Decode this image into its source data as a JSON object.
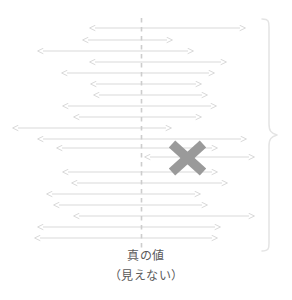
{
  "figure": {
    "title": "",
    "caption_primary": "真の値",
    "caption_secondary": "（見えない）",
    "colors": {
      "arrow": "#d9d9d9",
      "arrow_dark": "#cfcfcf",
      "dashed_line": "#cfcfcf",
      "x_marker": "#9a9a9a",
      "brace": "#e2e2e2",
      "text": "#5a5a5a",
      "background": "#ffffff"
    }
  },
  "chart_data": {
    "type": "line",
    "xlabel": "",
    "ylabel": "",
    "grid": false,
    "legend": "none",
    "true_value_x": 141,
    "xlim": [
      0,
      292
    ],
    "series": [
      {
        "name": "intervals",
        "interval_count": 20,
        "values": [
          {
            "row": 1,
            "y": 28,
            "left": 95,
            "right": 240,
            "covers": true,
            "marked": false
          },
          {
            "row": 2,
            "y": 40,
            "left": 88,
            "right": 167,
            "covers": true,
            "marked": false
          },
          {
            "row": 3,
            "y": 51,
            "left": 43,
            "right": 188,
            "covers": true,
            "marked": false
          },
          {
            "row": 4,
            "y": 62,
            "left": 95,
            "right": 221,
            "covers": true,
            "marked": false
          },
          {
            "row": 5,
            "y": 73,
            "left": 67,
            "right": 209,
            "covers": true,
            "marked": false
          },
          {
            "row": 6,
            "y": 84,
            "left": 96,
            "right": 196,
            "covers": true,
            "marked": false
          },
          {
            "row": 7,
            "y": 95,
            "left": 99,
            "right": 202,
            "covers": true,
            "marked": false
          },
          {
            "row": 8,
            "y": 106,
            "left": 68,
            "right": 211,
            "covers": true,
            "marked": false
          },
          {
            "row": 9,
            "y": 117,
            "left": 79,
            "right": 196,
            "covers": true,
            "marked": false
          },
          {
            "row": 10,
            "y": 128,
            "left": 18,
            "right": 166,
            "covers": true,
            "marked": false
          },
          {
            "row": 11,
            "y": 139,
            "left": 43,
            "right": 241,
            "covers": true,
            "marked": false
          },
          {
            "row": 12,
            "y": 148,
            "left": 62,
            "right": 212,
            "covers": true,
            "marked": false
          },
          {
            "row": 13,
            "y": 157,
            "left": 150,
            "right": 249,
            "covers": false,
            "marked": true
          },
          {
            "row": 14,
            "y": 172,
            "left": 68,
            "right": 212,
            "covers": true,
            "marked": false
          },
          {
            "row": 15,
            "y": 183,
            "left": 77,
            "right": 222,
            "covers": true,
            "marked": false
          },
          {
            "row": 16,
            "y": 194,
            "left": 52,
            "right": 195,
            "covers": true,
            "marked": false
          },
          {
            "row": 17,
            "y": 205,
            "left": 59,
            "right": 202,
            "covers": true,
            "marked": false
          },
          {
            "row": 18,
            "y": 216,
            "left": 79,
            "right": 249,
            "covers": true,
            "marked": false
          },
          {
            "row": 19,
            "y": 227,
            "left": 43,
            "right": 215,
            "covers": true,
            "marked": false
          },
          {
            "row": 20,
            "y": 238,
            "left": 40,
            "right": 212,
            "covers": true,
            "marked": false
          }
        ]
      }
    ],
    "annotations": [
      {
        "name": "x-marker",
        "x": 187,
        "y": 157,
        "label": "X",
        "meaning": "interval missing the true value"
      },
      {
        "name": "true-value-line",
        "x": 141,
        "y_top": 18,
        "y_bottom": 252,
        "style": "dashed"
      },
      {
        "name": "right-brace",
        "x": 258,
        "y_top": 18,
        "y_bottom": 252,
        "tip_y": 135
      }
    ]
  }
}
